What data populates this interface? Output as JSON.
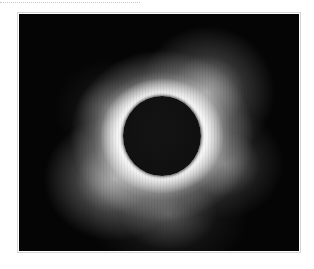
{
  "page": {
    "background": "#ffffff",
    "dotted_rule": {
      "color": "#c8c8c8"
    }
  },
  "photo": {
    "subject": "Total solar eclipse with white corona around dark moon disc",
    "alt": "Total solar eclipse: dark lunar disc surrounded by a bright white corona on a black sky",
    "colors": {
      "sky": "#050505",
      "corona": "#ffffff",
      "moon": "#121212",
      "frame_border": "#d6d6d6"
    }
  }
}
